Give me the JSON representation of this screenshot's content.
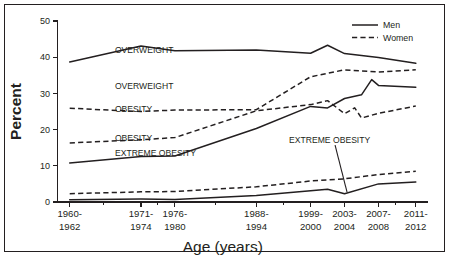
{
  "chart_data": {
    "type": "line",
    "title": "",
    "subtitle": "",
    "xlabel": "Age (years)",
    "ylabel": "Percent",
    "categories": [
      "1960-\n1962",
      "1971-\n1974",
      "1976-\n1980",
      "1988-\n1994",
      "1999-\n2000",
      "2003-\n2004",
      "2007-\n2008",
      "2011-\n2012"
    ],
    "x_tick_labels_line1": [
      "1960-",
      "1971-",
      "1976-",
      "1988-",
      "1999-",
      "2003-",
      "2007-",
      "2011-"
    ],
    "x_tick_labels_line2": [
      "1962",
      "1974",
      "1980",
      "1994",
      "2000",
      "2004",
      "2008",
      "2012"
    ],
    "x_positions": [
      0,
      1.05,
      1.55,
      2.75,
      3.55,
      4.05,
      4.55,
      5.1
    ],
    "xlim": [
      -0.18,
      5.28
    ],
    "ylim": [
      0,
      50
    ],
    "y_ticks": [
      0,
      10,
      20,
      30,
      40,
      50
    ],
    "y_tick_labels": [
      "0",
      "10",
      "20",
      "30",
      "40",
      "50"
    ],
    "grid": false,
    "legend_position": "top-right",
    "legend": [
      {
        "name": "Men",
        "style": "solid"
      },
      {
        "name": "Women",
        "style": "dashed"
      }
    ],
    "series": [
      {
        "name": "Overweight - Men",
        "sex": "Men",
        "condition": "OVERWEIGHT",
        "style": "solid",
        "values": [
          38.7,
          43.1,
          41.8,
          42.0,
          41.1,
          41.0,
          39.9,
          38.3
        ],
        "extra_points": [
          {
            "x": 3.8,
            "y": 43.3
          }
        ]
      },
      {
        "name": "Overweight - Women",
        "sex": "Women",
        "condition": "OVERWEIGHT",
        "style": "dashed",
        "values": [
          25.9,
          25.0,
          25.4,
          25.5,
          34.6,
          36.5,
          35.9,
          36.5
        ],
        "extra_points": []
      },
      {
        "name": "Obesity - Men",
        "sex": "Men",
        "condition": "OBESITY",
        "style": "solid",
        "values": [
          10.8,
          12.6,
          12.7,
          20.3,
          26.4,
          28.6,
          32.2,
          31.7
        ],
        "extra_points": [
          {
            "x": 3.8,
            "y": 26.0
          },
          {
            "x": 4.3,
            "y": 29.6
          },
          {
            "x": 4.45,
            "y": 33.8
          }
        ]
      },
      {
        "name": "Obesity - Women",
        "sex": "Women",
        "condition": "OBESITY",
        "style": "dashed",
        "values": [
          16.3,
          17.2,
          17.8,
          25.2,
          26.9,
          24.4,
          24.5,
          26.5
        ],
        "extra_points": [
          {
            "x": 3.8,
            "y": 28.0
          },
          {
            "x": 4.2,
            "y": 26.0
          },
          {
            "x": 4.3,
            "y": 23.2
          }
        ]
      },
      {
        "name": "Extreme obesity - Men",
        "sex": "Men",
        "condition": "EXTREME OBESITY",
        "style": "solid",
        "values": [
          0.6,
          0.8,
          0.7,
          1.8,
          3.1,
          2.3,
          5.0,
          5.5
        ],
        "extra_points": [
          {
            "x": 3.8,
            "y": 3.5
          }
        ]
      },
      {
        "name": "Extreme obesity - Women",
        "sex": "Women",
        "condition": "EXTREME OBESITY",
        "style": "dashed",
        "values": [
          2.3,
          2.8,
          2.9,
          4.2,
          5.8,
          6.4,
          7.6,
          8.5
        ],
        "extra_points": []
      }
    ],
    "annotations": [
      {
        "text": "OVERWEIGHT",
        "series": "Overweight - Men",
        "x_pct": 0.155,
        "y_pct": 0.175
      },
      {
        "text": "OVERWEIGHT",
        "series": "Overweight - Women",
        "x_pct": 0.155,
        "y_pct": 0.375
      },
      {
        "text": "OBESITY",
        "series": "Obesity - Women",
        "x_pct": 0.155,
        "y_pct": 0.505
      },
      {
        "text": "OBESITY",
        "series": "Obesity - Men",
        "x_pct": 0.155,
        "y_pct": 0.665
      },
      {
        "text": "EXTREME OBESITY",
        "series": "Extreme obesity - Women",
        "x_pct": 0.155,
        "y_pct": 0.745
      },
      {
        "text": "EXTREME OBESITY",
        "series": "Extreme obesity - Men",
        "x_pct": 0.625,
        "y_pct": 0.672,
        "leader": true
      }
    ]
  },
  "figure": {
    "background": "#ffffff",
    "ink_color": "#231f20",
    "border_color": "#231f20"
  }
}
